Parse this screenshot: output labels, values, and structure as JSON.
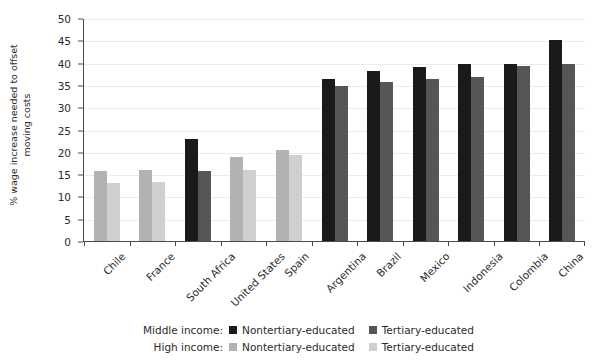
{
  "chart_data": {
    "type": "bar",
    "title": "",
    "xlabel": "",
    "ylabel": "% wage increase needed to offset moving costs",
    "ylim": [
      0,
      50
    ],
    "yticks": [
      0,
      5,
      10,
      15,
      20,
      25,
      30,
      35,
      40,
      45,
      50
    ],
    "grid": true,
    "legend_position": "bottom",
    "categories": [
      "Chile",
      "France",
      "South Africa",
      "United States",
      "Spain",
      "Argentina",
      "Brazil",
      "Mexico",
      "Indonesia",
      "Colombia",
      "China"
    ],
    "income_group": [
      "High income",
      "High income",
      "Middle income",
      "High income",
      "High income",
      "Middle income",
      "Middle income",
      "Middle income",
      "Middle income",
      "Middle income",
      "Middle income"
    ],
    "series": [
      {
        "name": "Nontertiary-educated",
        "values": [
          15.8,
          15.9,
          22.8,
          18.8,
          20.4,
          36.3,
          38.2,
          39.0,
          39.7,
          39.8,
          45.0
        ]
      },
      {
        "name": "Tertiary-educated",
        "values": [
          13.1,
          13.2,
          15.6,
          16.0,
          19.2,
          34.7,
          35.6,
          36.3,
          36.7,
          39.2,
          39.8
        ]
      }
    ]
  },
  "colors": {
    "middle_nontertiary": "#1a1a1a",
    "middle_tertiary": "#565656",
    "high_nontertiary": "#b2b2b2",
    "high_tertiary": "#cfcfcf",
    "axis": "#4a4a4a",
    "grid": "#ececec",
    "text": "#2b2b2b"
  },
  "axis": {
    "y_title_line1": "% wage increase needed to offset",
    "y_title_line2": "moving costs"
  },
  "legend": {
    "rows": [
      {
        "title": "Middle income:",
        "items": [
          {
            "label": "Nontertiary-educated",
            "color_key": "middle_nontertiary"
          },
          {
            "label": "Tertiary-educated",
            "color_key": "middle_tertiary"
          }
        ]
      },
      {
        "title": "High income:",
        "items": [
          {
            "label": "Nontertiary-educated",
            "color_key": "high_nontertiary"
          },
          {
            "label": "Tertiary-educated",
            "color_key": "high_tertiary"
          }
        ]
      }
    ]
  }
}
